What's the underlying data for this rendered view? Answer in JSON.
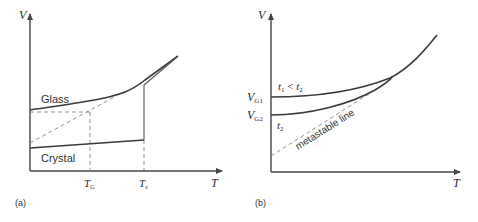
{
  "panel_a": {
    "label": "(a)",
    "y_axis_label": "V",
    "x_axis_label": "T",
    "glass_label": "Glass",
    "crystal_label": "Crystal",
    "tick_tg": "T",
    "tick_tg_sub": "G",
    "tick_ts": "T",
    "tick_ts_sub": "s"
  },
  "panel_b": {
    "label": "(b)",
    "y_axis_label": "V",
    "x_axis_label": "T",
    "vg1": "V",
    "vg1_sub": "G1",
    "vg2": "V",
    "vg2_sub": "G2",
    "t1_label": "t",
    "t1_sub": "1",
    "t1_rel": " < ",
    "t2_inline": "t",
    "t2_inline_sub": "2",
    "t2_label": "t",
    "t2_sub": "2",
    "metastable_label": "metastable line"
  },
  "colors": {
    "line": "#3a3a3a",
    "dashed": "#777777",
    "background": "#ffffff"
  }
}
